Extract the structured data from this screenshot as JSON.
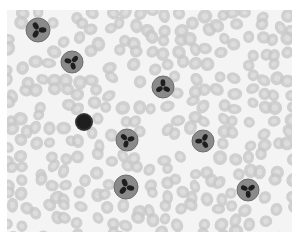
{
  "image": {
    "subject": "blood smear micrograph",
    "mode": "grayscale",
    "colors": {
      "background": "#f4f4f4",
      "rbc_fill": "#c9c9c9",
      "rbc_center": "#dedede",
      "cytoplasm": "#8a8a8a",
      "nucleus": "#1e1e1e"
    },
    "neutrophils": [
      {
        "cx": 31,
        "cy": 20,
        "r": 12
      },
      {
        "cx": 65,
        "cy": 52,
        "r": 11
      },
      {
        "cx": 156,
        "cy": 77,
        "r": 11
      },
      {
        "cx": 120,
        "cy": 130,
        "r": 11
      },
      {
        "cx": 196,
        "cy": 131,
        "r": 11
      },
      {
        "cx": 119,
        "cy": 177,
        "r": 12
      },
      {
        "cx": 241,
        "cy": 180,
        "r": 11
      }
    ],
    "lymphocytes": [
      {
        "cx": 77,
        "cy": 112,
        "r": 9
      }
    ]
  }
}
